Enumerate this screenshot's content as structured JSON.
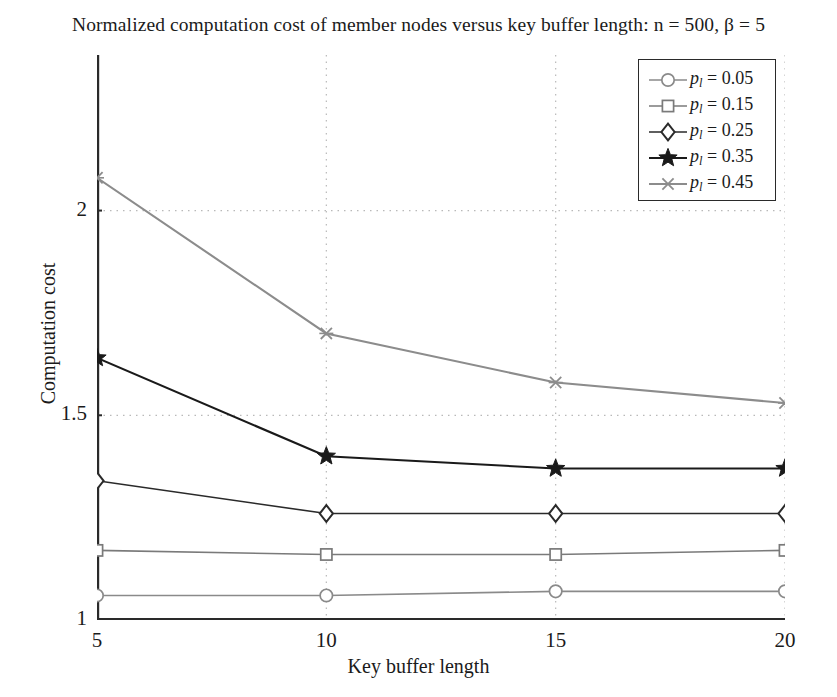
{
  "chart_data": {
    "type": "line",
    "title": "Normalized computation cost of member nodes versus key buffer length: n = 500, β = 5",
    "xlabel": "Key buffer length",
    "ylabel": "Computation cost",
    "x": [
      5,
      10,
      15,
      20
    ],
    "xlim": [
      5,
      20
    ],
    "ylim": [
      1,
      2.38
    ],
    "xticks": [
      5,
      10,
      15,
      20
    ],
    "xtick_labels": [
      "5",
      "10",
      "15",
      "20"
    ],
    "yticks": [
      1,
      1.5,
      2
    ],
    "ytick_labels": [
      "1",
      "1.5",
      "2"
    ],
    "grid": "dotted-both",
    "legend_position": "top-right",
    "series": [
      {
        "name": "p_l = 0.05",
        "label": "0.05",
        "marker": "circle",
        "color": "#8a8a8a",
        "values": [
          1.06,
          1.06,
          1.07,
          1.07
        ]
      },
      {
        "name": "p_l = 0.15",
        "label": "0.15",
        "marker": "square",
        "color": "#7a7a7a",
        "values": [
          1.17,
          1.16,
          1.16,
          1.17
        ]
      },
      {
        "name": "p_l = 0.25",
        "label": "0.25",
        "marker": "diamond",
        "color": "#2a2a2a",
        "values": [
          1.34,
          1.26,
          1.26,
          1.26
        ]
      },
      {
        "name": "p_l = 0.35",
        "label": "0.35",
        "marker": "star",
        "color": "#1a1a1a",
        "values": [
          1.64,
          1.4,
          1.37,
          1.37
        ]
      },
      {
        "name": "p_l = 0.45",
        "label": "0.45",
        "marker": "x",
        "color": "#8c8c8c",
        "values": [
          2.08,
          1.7,
          1.58,
          1.53
        ]
      }
    ]
  },
  "legend": {
    "entries": [
      {
        "symbol": "p",
        "subscript": "l",
        "equals": "= 0.05"
      },
      {
        "symbol": "p",
        "subscript": "l",
        "equals": "= 0.15"
      },
      {
        "symbol": "p",
        "subscript": "l",
        "equals": "= 0.25"
      },
      {
        "symbol": "p",
        "subscript": "l",
        "equals": "= 0.35"
      },
      {
        "symbol": "p",
        "subscript": "l",
        "equals": "= 0.45"
      }
    ]
  },
  "colors": {
    "axis": "#2a2a2a",
    "grid": "#b9b9b9",
    "background": "#ffffff",
    "text": "#1b1b1b"
  }
}
